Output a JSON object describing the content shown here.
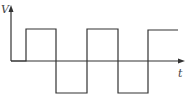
{
  "diagram": {
    "type": "square-wave",
    "y_axis_label": "V",
    "x_axis_label": "t",
    "line_color": "#333333",
    "waveform_points": [
      [
        11,
        61
      ],
      [
        26,
        61
      ],
      [
        26,
        29
      ],
      [
        56,
        29
      ],
      [
        56,
        93
      ],
      [
        87,
        93
      ],
      [
        87,
        29
      ],
      [
        118,
        29
      ],
      [
        118,
        93
      ],
      [
        148,
        93
      ],
      [
        148,
        30
      ],
      [
        178,
        30
      ]
    ]
  }
}
